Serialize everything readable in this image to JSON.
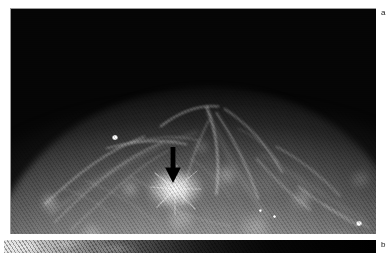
{
  "figure": {
    "type": "radiographic-image-figure",
    "modality": "mammogram",
    "background_color": "#ffffff",
    "width": 391,
    "height": 253,
    "panels": [
      {
        "id": "a",
        "label": "a",
        "label_position": "top-right",
        "rect": {
          "x": 10,
          "y": 8,
          "width": 366,
          "height": 226
        },
        "background_color": "#050505",
        "description": "Mammographic view of breast parenchyma; dense fibroglandular tissue forms a dome against a black background, with a black arrow marking a spiculated mass.",
        "markers": [
          {
            "name": "arrow-marker",
            "glyph": "down-arrow",
            "color": "#000000",
            "x": 152,
            "y": 138,
            "width": 20,
            "height": 36,
            "points_to": "spiculated-mass"
          }
        ],
        "features": [
          {
            "name": "spiculated-mass",
            "x": 164,
            "y": 181,
            "brightness": "high"
          },
          {
            "name": "calcification-spot",
            "x": 113,
            "y": 136,
            "brightness": "very-high"
          },
          {
            "name": "calcification-spot",
            "x": 355,
            "y": 222,
            "brightness": "very-high"
          },
          {
            "name": "calcification-spot",
            "x": 258,
            "y": 210,
            "brightness": "high"
          },
          {
            "name": "skin-line",
            "orientation": "arching-dome"
          }
        ]
      },
      {
        "id": "b",
        "label": "b",
        "label_position": "bottom-right",
        "rect": {
          "x": 4,
          "y": 240,
          "width": 372,
          "height": 13
        },
        "background_color": "#000000",
        "description": "Cropped upper strip of a second mammographic panel; bright tissue at left fading to black at right.",
        "markers": [],
        "features": []
      }
    ],
    "colors": {
      "page_background": "#ffffff",
      "image_black": "#000000",
      "tissue_bright": "#f2f2f2",
      "label_text": "#1a1a1a",
      "marker": "#000000"
    }
  }
}
